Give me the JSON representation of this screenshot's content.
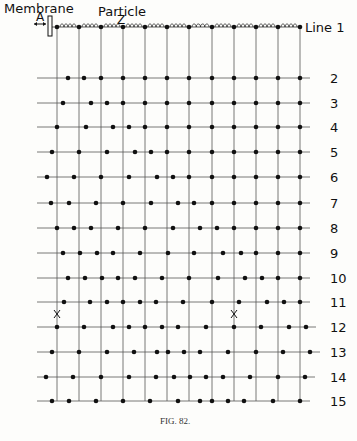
{
  "labels": {
    "membrane": "Membrane",
    "membrane_letter": "A",
    "particle": "Particle",
    "particle_letter": "Z",
    "caption": "FIG. 82."
  },
  "rows": [
    {
      "label": "Line 1",
      "y": 27,
      "dots": [
        57,
        79,
        101,
        123,
        145,
        167,
        189,
        212,
        234,
        256,
        278,
        300
      ]
    },
    {
      "label": "2",
      "y": 78,
      "dots": [
        68,
        84,
        101,
        123,
        145,
        167,
        189,
        212,
        234,
        256,
        278,
        300
      ]
    },
    {
      "label": "3",
      "y": 103,
      "dots": [
        63,
        91,
        107,
        123,
        145,
        167,
        189,
        212,
        234,
        256,
        278,
        300
      ]
    },
    {
      "label": "4",
      "y": 127,
      "dots": [
        57,
        86,
        113,
        129,
        145,
        167,
        189,
        212,
        234,
        256,
        278,
        300
      ]
    },
    {
      "label": "5",
      "y": 152,
      "dots": [
        52,
        79,
        107,
        135,
        151,
        167,
        189,
        212,
        234,
        256,
        278,
        300
      ]
    },
    {
      "label": "6",
      "y": 177,
      "dots": [
        47,
        74,
        101,
        129,
        157,
        173,
        189,
        212,
        234,
        256,
        278,
        300
      ]
    },
    {
      "label": "7",
      "y": 203,
      "dots": [
        51,
        69,
        96,
        123,
        151,
        178,
        194,
        212,
        234,
        256,
        278,
        300
      ]
    },
    {
      "label": "8",
      "y": 228,
      "dots": [
        57,
        74,
        91,
        118,
        145,
        173,
        200,
        217,
        234,
        256,
        278,
        300
      ]
    },
    {
      "label": "9",
      "y": 253,
      "dots": [
        63,
        80,
        97,
        113,
        140,
        168,
        194,
        223,
        241,
        256,
        278,
        300
      ]
    },
    {
      "label": "10",
      "y": 278,
      "dots": [
        68,
        85,
        102,
        118,
        135,
        162,
        189,
        218,
        245,
        262,
        278,
        300
      ]
    },
    {
      "label": "11",
      "y": 302,
      "dots": [
        64,
        90,
        107,
        123,
        140,
        156,
        183,
        212,
        239,
        267,
        284,
        300
      ]
    },
    {
      "label": "12",
      "y": 327,
      "dots": [
        57,
        84,
        113,
        129,
        145,
        162,
        178,
        206,
        234,
        261,
        289,
        306
      ]
    },
    {
      "label": "13",
      "y": 352,
      "dots": [
        52,
        79,
        107,
        134,
        157,
        168,
        184,
        200,
        228,
        256,
        283,
        310
      ]
    },
    {
      "label": "14",
      "y": 377,
      "dots": [
        46,
        73,
        101,
        129,
        156,
        174,
        190,
        206,
        223,
        250,
        278,
        305
      ]
    },
    {
      "label": "15",
      "y": 401,
      "dots": [
        52,
        69,
        96,
        123,
        150,
        178,
        200,
        212,
        228,
        244,
        273,
        300
      ]
    }
  ],
  "vertical_lines_x": [
    57,
    79,
    101,
    123,
    145,
    167,
    189,
    212,
    234,
    256,
    278,
    300
  ],
  "x_markers": [
    {
      "x": 57,
      "y": 314
    },
    {
      "x": 234,
      "y": 314
    }
  ]
}
